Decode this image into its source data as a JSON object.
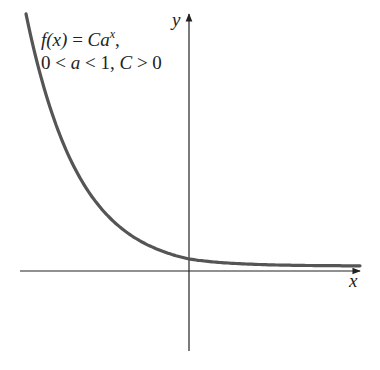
{
  "diagram": {
    "formula": {
      "function_name": "f(x)",
      "equals": "=",
      "base_constant": "C",
      "base": "a",
      "exponent": "x",
      "trailing": ",",
      "conditions": "0 < a < 1, C > 0",
      "conditions_parts": [
        "0 <",
        "a",
        "< 1,",
        "C",
        "> 0"
      ]
    },
    "axes": {
      "x_label": "x",
      "y_label": "y"
    },
    "curve": {
      "description": "Decreasing exponential curve f(x) = C a^x with 0 < a < 1, approaching the x-axis as x increases and crossing the y-axis at y = C",
      "color": "#555555"
    },
    "colors": {
      "axes": "#222222",
      "curve": "#555555",
      "text": "#222222",
      "background": "#ffffff"
    }
  }
}
